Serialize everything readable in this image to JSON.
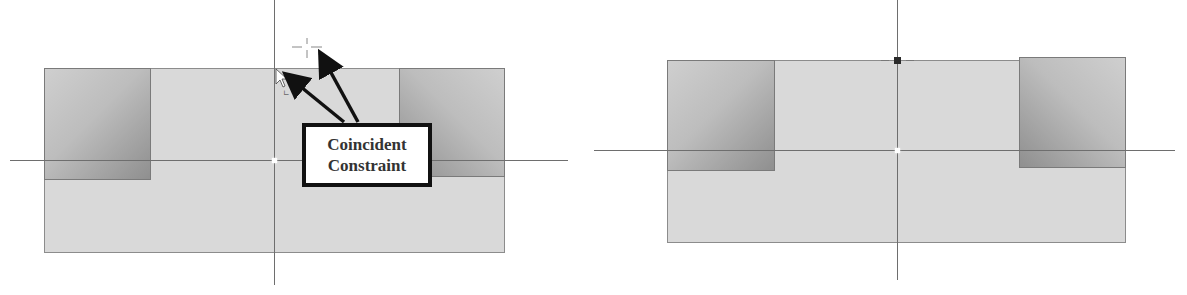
{
  "figure": {
    "panels": [
      {
        "id": "before",
        "description": "Sketch with cursor dragging endpoint to origin axis",
        "callout": {
          "line1": "Coincident",
          "line2": "Constraint"
        }
      },
      {
        "id": "after",
        "description": "Sketch after coincident constraint applied"
      }
    ],
    "colors": {
      "sketch_fill": "#d9d9d9",
      "sketch_border": "#8c8c8c",
      "axis": "#6e6e6e",
      "callout_border": "#111111",
      "arrow": "#111111",
      "coincident_marker": "#2a2a2a"
    },
    "icons": {
      "cursor": "mouse-pointer-arrow",
      "crosshair": "dashed-crosshair",
      "origin": "origin-point",
      "constraint_marker": "coincident-square"
    }
  }
}
